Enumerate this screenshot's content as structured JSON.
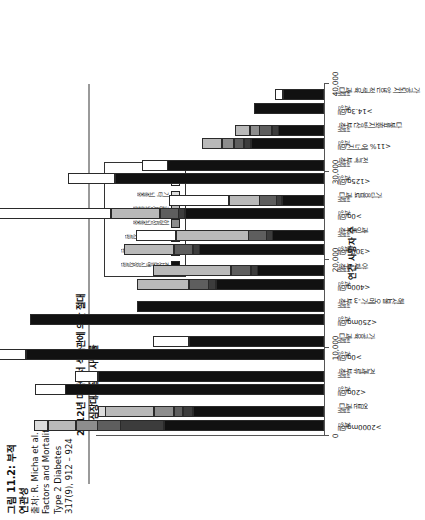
{
  "figure": {
    "number_label": "그림 11.2:",
    "title_ko_1": "부적",
    "subtitle_ko": "연관성",
    "source_lines": [
      "출처: R. Micha et al.",
      "Factors and Mortality",
      "Type 2 Diabetes",
      "317(9), 912 – 924"
    ]
  },
  "chart_title": {
    "line1": "2012년 미국에서 식습관에 의한 절대",
    "line2": "심장대사질환 사망률"
  },
  "axis": {
    "name": "연간 사망자 수",
    "ticks": [
      "0",
      "10,000",
      "20,000",
      "30,000",
      "40,000"
    ],
    "tick_values": [
      0,
      10000,
      20000,
      30000,
      40000
    ],
    "min": 0,
    "max": 40000
  },
  "legend": {
    "items": [
      {
        "label": "관상동맥심장질환",
        "color": "#111111"
      },
      {
        "label": "고혈압성심장질환",
        "color": "#3c3c3c"
      },
      {
        "label": "기타 심혈관질환",
        "color": "#5e5e5e"
      },
      {
        "label": "허혈성뇌졸중",
        "color": "#8d8d8d"
      },
      {
        "label": "출혈성뇌졸중",
        "color": "#b9b9b9"
      },
      {
        "label": "기타 뇌졸중",
        "color": "#dcdcdc"
      },
      {
        "label": "당뇨병",
        "color": "#ffffff"
      }
    ]
  },
  "group_sub_labels": [
    "과잉",
    "섭취"
  ],
  "categories": [
    {
      "label": "염분 과다",
      "threshold": ">2000mg/일",
      "sub": [
        "과잉",
        "섭취"
      ]
    },
    {
      "label": "견과류 부족",
      "threshold": "<20g/일",
      "sub": [
        "과잉",
        "섭취"
      ]
    },
    {
      "label": "가공육 과다",
      "threshold": ">0g/일",
      "sub": [
        "과잉",
        "섭취"
      ]
    },
    {
      "label": "해산물 오메가-3 부족",
      "threshold": "<250mg/일",
      "sub": [
        "과잉",
        "섭취"
      ]
    },
    {
      "label": "야채 부족",
      "threshold": "<400g/일",
      "sub": [
        "과잉",
        "섭취"
      ]
    },
    {
      "label": "과일 부족",
      "threshold": "<300g/일",
      "sub": [
        "과잉",
        "섭취"
      ]
    },
    {
      "label": "가당음료 과다",
      "threshold": ">0g/일",
      "sub": [
        "과잉",
        "섭취"
      ]
    },
    {
      "label": "전곡 부족",
      "threshold": "<125g/일",
      "sub": [
        "과잉",
        "섭취"
      ]
    },
    {
      "label": "다불포화지방산 부족",
      "threshold": "<11% 에너지/일",
      "sub": [
        "과잉",
        "섭취"
      ]
    },
    {
      "label": "가공되지 않은 적색육 과다",
      "threshold": ">14.3g/일",
      "sub": [
        "과잉",
        "섭취"
      ]
    }
  ],
  "chart_data": {
    "type": "bar",
    "orientation": "vertical-stacked",
    "title": "2012년 미국에서 식습관에 의한 절대 심장대사질환 사망률",
    "xlabel": "",
    "ylabel": "연간 사망자 수",
    "ylim": [
      0,
      40000
    ],
    "grid": false,
    "legend_position": "inside-top-right",
    "categories": [
      "염분 과다 >2000mg/일",
      "견과류 부족 <20g/일",
      "가공육 과다 >0g/일",
      "해산물 오메가-3 부족 <250mg/일",
      "야채 부족 <400g/일",
      "과일 부족 <300g/일",
      "가당음료 과다 >0g/일",
      "전곡 부족 <125g/일",
      "다불포화지방산 부족 <11% 에너지/일",
      "가공되지 않은 적색육 과다 >14.3g/일"
    ],
    "series": [
      {
        "name": "관상동맥심장질환",
        "color": "#111111",
        "values": [
          [
            18200,
            14900
          ],
          [
            29400,
            25700
          ],
          [
            33900,
            15400
          ],
          [
            33400,
            21300
          ],
          [
            12300,
            7600
          ],
          [
            14200,
            5900
          ],
          [
            15800,
            4800
          ],
          [
            23800,
            17800
          ],
          [
            8300,
            5200
          ],
          [
            7900,
            4700
          ]
        ]
      },
      {
        "name": "고혈압성심장질환",
        "color": "#3c3c3c",
        "values": [
          [
            5000,
            1200
          ],
          [
            0,
            0
          ],
          [
            0,
            0
          ],
          [
            0,
            0
          ],
          [
            900,
            800
          ],
          [
            800,
            700
          ],
          [
            800,
            700
          ],
          [
            0,
            0
          ],
          [
            900,
            800
          ],
          [
            0,
            0
          ]
        ]
      },
      {
        "name": "기타 심혈관질환",
        "color": "#5e5e5e",
        "values": [
          [
            2700,
            1100
          ],
          [
            0,
            0
          ],
          [
            0,
            0
          ],
          [
            0,
            0
          ],
          [
            2300,
            2300
          ],
          [
            2200,
            2100
          ],
          [
            2200,
            2000
          ],
          [
            0,
            0
          ],
          [
            1200,
            1500
          ],
          [
            0,
            0
          ]
        ]
      },
      {
        "name": "허혈성뇌졸중",
        "color": "#8d8d8d",
        "values": [
          [
            2500,
            2300
          ],
          [
            0,
            0
          ],
          [
            0,
            0
          ],
          [
            0,
            0
          ],
          [
            0,
            0
          ],
          [
            0,
            0
          ],
          [
            0,
            0
          ],
          [
            0,
            0
          ],
          [
            1400,
            1100
          ],
          [
            0,
            0
          ]
        ]
      },
      {
        "name": "출혈성뇌졸중",
        "color": "#b9b9b9",
        "values": [
          [
            3200,
            5600
          ],
          [
            0,
            0
          ],
          [
            0,
            0
          ],
          [
            0,
            0
          ],
          [
            5900,
            8900
          ],
          [
            5700,
            8300
          ],
          [
            5600,
            3500
          ],
          [
            0,
            0
          ],
          [
            2300,
            1800
          ],
          [
            0,
            0
          ]
        ]
      },
      {
        "name": "기타 뇌졸중",
        "color": "#dcdcdc",
        "values": [
          [
            1600,
            900
          ],
          [
            0,
            0
          ],
          [
            0,
            0
          ],
          [
            0,
            0
          ],
          [
            0,
            0
          ],
          [
            0,
            0
          ],
          [
            0,
            0
          ],
          [
            0,
            0
          ],
          [
            0,
            0
          ],
          [
            0,
            0
          ]
        ]
      },
      {
        "name": "당뇨병",
        "color": "#ffffff",
        "values": [
          [
            0,
            0
          ],
          [
            3500,
            2600
          ],
          [
            5900,
            4100
          ],
          [
            0,
            0
          ],
          [
            0,
            0
          ],
          [
            0,
            4600
          ],
          [
            14100,
            6800
          ],
          [
            5300,
            2900
          ],
          [
            0,
            0
          ],
          [
            0,
            900
          ]
        ]
      }
    ]
  }
}
